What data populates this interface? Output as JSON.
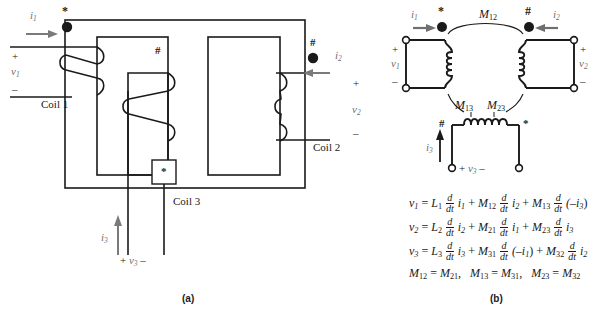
{
  "figure": {
    "panel_a": {
      "caption": "(a)",
      "labels": {
        "i1": "i",
        "i1_sub": "1",
        "v1": "v",
        "v1_sub": "1",
        "plus1": "+",
        "minus1": "–",
        "dot_star_left": "*",
        "hash_center": "#",
        "coil1": "Coil 1",
        "coil2": "Coil 2",
        "coil3": "Coil 3",
        "star_coil3": "*",
        "hash_right": "#",
        "i2": "i",
        "i2_sub": "2",
        "v2": "v",
        "v2_sub": "2",
        "plus2": "+",
        "minus2": "–",
        "i3": "i",
        "i3_sub": "3",
        "v3_plus": "+",
        "v3": "v",
        "v3_sub": "3",
        "v3_minus": "–"
      }
    },
    "panel_b": {
      "caption": "(b)",
      "labels": {
        "i1": "i",
        "i1_sub": "1",
        "i2": "i",
        "i2_sub": "2",
        "i3": "i",
        "i3_sub": "3",
        "v1": "v",
        "v1_sub": "1",
        "v2": "v",
        "v2_sub": "2",
        "v3": "v",
        "v3_sub": "3",
        "star_left": "*",
        "hash_right": "#",
        "hash_bottom": "#",
        "star_bottom": "*",
        "M12": "M",
        "M12_sub": "12",
        "M13": "M",
        "M13_sub": "13",
        "M23": "M",
        "M23_sub": "23",
        "plus_left": "+",
        "minus_left": "–",
        "plus_right": "+",
        "minus_right": "–",
        "plus_bottom": "+",
        "minus_bottom": "–"
      },
      "equations": {
        "eq1": {
          "lhs": "v",
          "lhs_sub": "1",
          "eq": "=",
          "t1_coef": "L",
          "t1_sub": "1",
          "t1_var": "i",
          "t1_varsub": "1",
          "t2_op": "+",
          "t2_coef": "M",
          "t2_sub": "12",
          "t2_var": "i",
          "t2_varsub": "2",
          "t3_op": "+",
          "t3_coef": "M",
          "t3_sub": "13",
          "t3_var": "(–i",
          "t3_varsub": "3",
          "t3_close": ")"
        },
        "eq2": {
          "lhs": "v",
          "lhs_sub": "2",
          "eq": "=",
          "t1_coef": "L",
          "t1_sub": "2",
          "t1_var": "i",
          "t1_varsub": "2",
          "t2_op": "+",
          "t2_coef": "M",
          "t2_sub": "21",
          "t2_var": "i",
          "t2_varsub": "1",
          "t3_op": "+",
          "t3_coef": "M",
          "t3_sub": "23",
          "t3_var": "i",
          "t3_varsub": "3",
          "t3_close": ""
        },
        "eq3": {
          "lhs": "v",
          "lhs_sub": "3",
          "eq": "=",
          "t1_coef": "L",
          "t1_sub": "3",
          "t1_var": "i",
          "t1_varsub": "3",
          "t2_op": "+",
          "t2_coef": "M",
          "t2_sub": "31",
          "t2_var": "(–i",
          "t2_varsub": "1",
          "t2_close": ")",
          "t3_op": "+",
          "t3_coef": "M",
          "t3_sub": "32",
          "t3_var": "i",
          "t3_varsub": "2"
        },
        "eq4": {
          "a_l": "M",
          "a_l_sub": "12",
          "a_eq": "=",
          "a_r": "M",
          "a_r_sub": "21",
          "a_comma": ",",
          "b_l": "M",
          "b_l_sub": "13",
          "b_eq": "=",
          "b_r": "M",
          "b_r_sub": "31",
          "b_comma": ",",
          "c_l": "M",
          "c_l_sub": "23",
          "c_eq": "=",
          "c_r": "M",
          "c_r_sub": "32"
        },
        "dd_num": "d",
        "dd_den": "dt"
      }
    }
  },
  "colors": {
    "ink": "#1a1a1a",
    "gray_label": "#6f6f6f",
    "gray_arrow": "#7a7a7a",
    "background": "#ffffff"
  }
}
